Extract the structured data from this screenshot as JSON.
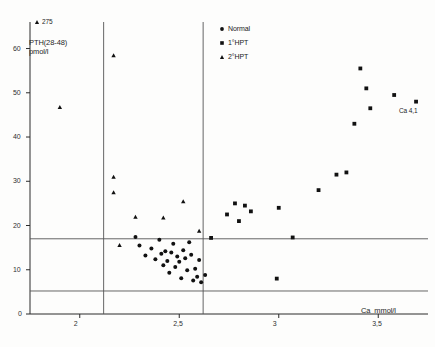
{
  "figure": {
    "caption_bottom": ""
  },
  "chart_data": {
    "type": "scatter",
    "title": "",
    "xlabel": "Ca  mmol/l",
    "ylabel": "PTH(28-48)\npmol/l",
    "ylabel_line1": "PTH(28-48)",
    "ylabel_line2": "pmol/l",
    "xlim": [
      1.75,
      3.75
    ],
    "ylim": [
      0,
      66
    ],
    "grid": false,
    "x_ticks": [
      2,
      2.5,
      3,
      3.5
    ],
    "x_tick_labels": [
      "2",
      "2,5",
      "3",
      "3,5"
    ],
    "y_ticks": [
      0,
      10,
      20,
      30,
      40,
      50,
      60
    ],
    "y_tick_labels": [
      "0",
      "10",
      "20",
      "30",
      "40",
      "50",
      "60"
    ],
    "legend_position": "top-right",
    "reference_lines": {
      "vertical": [
        2.12,
        2.62
      ],
      "horizontal": [
        17.0,
        5.2
      ]
    },
    "annotations": [
      {
        "text": "275",
        "x": 1.87,
        "y": 64.5,
        "marker": "triangle",
        "note": "off-scale point label"
      },
      {
        "text": "Ca 4,1",
        "x": 3.66,
        "y": 47.0,
        "marker": "none",
        "note": "off-scale x label"
      }
    ],
    "series": [
      {
        "name": "Normal",
        "marker": "circle",
        "color": "#111111",
        "points": [
          [
            2.3,
            15.5
          ],
          [
            2.33,
            13.2
          ],
          [
            2.36,
            14.8
          ],
          [
            2.38,
            12.4
          ],
          [
            2.4,
            16.8
          ],
          [
            2.41,
            13.6
          ],
          [
            2.42,
            11.0
          ],
          [
            2.43,
            14.2
          ],
          [
            2.44,
            12.0
          ],
          [
            2.45,
            9.3
          ],
          [
            2.46,
            13.9
          ],
          [
            2.47,
            15.9
          ],
          [
            2.48,
            10.6
          ],
          [
            2.49,
            13.0
          ],
          [
            2.5,
            11.8
          ],
          [
            2.51,
            8.1
          ],
          [
            2.52,
            14.4
          ],
          [
            2.53,
            12.6
          ],
          [
            2.54,
            9.9
          ],
          [
            2.55,
            16.2
          ],
          [
            2.56,
            13.4
          ],
          [
            2.57,
            7.6
          ],
          [
            2.58,
            10.2
          ],
          [
            2.59,
            8.4
          ],
          [
            2.6,
            12.2
          ],
          [
            2.61,
            7.2
          ],
          [
            2.63,
            8.8
          ],
          [
            2.28,
            17.4
          ]
        ]
      },
      {
        "name": "1°HPT",
        "marker": "square",
        "color": "#111111",
        "points": [
          [
            2.66,
            17.2
          ],
          [
            2.74,
            22.5
          ],
          [
            2.78,
            25.0
          ],
          [
            2.8,
            21.0
          ],
          [
            2.83,
            24.5
          ],
          [
            2.86,
            23.2
          ],
          [
            2.99,
            8.0
          ],
          [
            3.0,
            24.0
          ],
          [
            3.07,
            17.3
          ],
          [
            3.2,
            28.0
          ],
          [
            3.29,
            31.5
          ],
          [
            3.34,
            32.0
          ],
          [
            3.38,
            43.0
          ],
          [
            3.41,
            55.5
          ],
          [
            3.44,
            51.0
          ],
          [
            3.46,
            46.5
          ],
          [
            3.58,
            49.5
          ],
          [
            3.69,
            48.0
          ]
        ]
      },
      {
        "name": "2°HPT",
        "marker": "triangle",
        "color": "#111111",
        "points": [
          [
            1.9,
            46.8
          ],
          [
            2.17,
            58.5
          ],
          [
            2.17,
            31.0
          ],
          [
            2.17,
            27.5
          ],
          [
            2.2,
            15.6
          ],
          [
            2.28,
            22.0
          ],
          [
            2.42,
            21.8
          ],
          [
            2.6,
            18.8
          ],
          [
            2.52,
            25.5
          ]
        ]
      }
    ],
    "legend": [
      {
        "label": "Normal",
        "marker": "circle"
      },
      {
        "label": "1°HPT",
        "marker": "square"
      },
      {
        "label": "2°HPT",
        "marker": "triangle"
      }
    ]
  }
}
